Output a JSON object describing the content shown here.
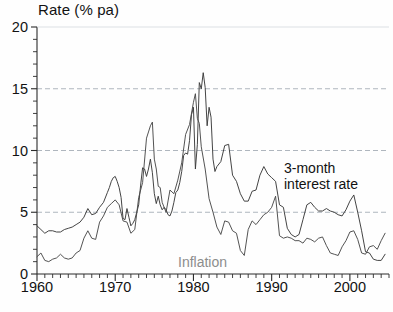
{
  "chart_data": {
    "type": "line",
    "title": "Rate (% pa)",
    "xlabel": "",
    "ylabel": "Rate (% pa)",
    "xlim": [
      1960,
      2005
    ],
    "ylim": [
      0,
      20
    ],
    "yticks": [
      0,
      5,
      10,
      15,
      20
    ],
    "ytick_labels": [
      "0",
      "5",
      "10",
      "15",
      "20"
    ],
    "yminor_step": 1,
    "xticks": [
      1960,
      1970,
      1980,
      1990,
      2000
    ],
    "xtick_labels": [
      "1960",
      "1970",
      "1980",
      "1990",
      "2000"
    ],
    "xminor_step": 1,
    "grid": "horizontal-dashed-at-major-yticks",
    "legend": "inline-annotations",
    "annotations": [
      {
        "name": "interest-rate-annotation",
        "text": "3-month\ninterest rate",
        "color": "#111111",
        "x": 284,
        "y": 160
      },
      {
        "name": "inflation-annotation",
        "text": "Inflation",
        "color": "#8d8d8d",
        "x": 178,
        "y": 254
      }
    ],
    "series": [
      {
        "name": "3-month interest rate",
        "color": "#3a3a3a",
        "x": [
          1960.0,
          1960.5,
          1961.0,
          1961.5,
          1962.0,
          1962.5,
          1963.0,
          1963.5,
          1964.0,
          1964.5,
          1965.0,
          1965.5,
          1966.0,
          1966.5,
          1967.0,
          1967.5,
          1968.0,
          1968.5,
          1969.0,
          1969.25,
          1969.5,
          1969.75,
          1970.0,
          1970.25,
          1970.5,
          1970.75,
          1971.0,
          1971.25,
          1971.5,
          1971.75,
          1972.0,
          1972.25,
          1972.5,
          1972.75,
          1973.0,
          1973.25,
          1973.5,
          1973.75,
          1974.0,
          1974.25,
          1974.5,
          1974.75,
          1975.0,
          1975.25,
          1975.5,
          1975.75,
          1976.0,
          1976.25,
          1976.5,
          1976.75,
          1977.0,
          1977.25,
          1977.5,
          1977.75,
          1978.0,
          1978.25,
          1978.5,
          1978.75,
          1979.0,
          1979.25,
          1979.5,
          1979.75,
          1980.0,
          1980.25,
          1980.5,
          1980.75,
          1981.0,
          1981.25,
          1981.5,
          1981.75,
          1982.0,
          1982.25,
          1982.5,
          1982.75,
          1983.0,
          1983.5,
          1984.0,
          1984.5,
          1985.0,
          1985.5,
          1986.0,
          1986.5,
          1987.0,
          1987.5,
          1988.0,
          1988.5,
          1989.0,
          1989.5,
          1990.0,
          1990.5,
          1991.0,
          1991.5,
          1992.0,
          1992.5,
          1993.0,
          1993.5,
          1994.0,
          1994.5,
          1995.0,
          1995.5,
          1996.0,
          1996.5,
          1997.0,
          1997.5,
          1998.0,
          1998.5,
          1999.0,
          1999.5,
          2000.0,
          2000.5,
          2001.0,
          2001.5,
          2002.0,
          2002.5,
          2003.0,
          2003.5,
          2004.0,
          2004.5
        ],
        "y": [
          3.9,
          3.6,
          3.3,
          3.5,
          3.5,
          3.4,
          3.4,
          3.6,
          3.7,
          3.8,
          4.0,
          4.2,
          4.6,
          5.3,
          4.8,
          4.9,
          5.4,
          5.8,
          6.6,
          7.0,
          7.5,
          7.8,
          7.9,
          7.5,
          7.0,
          6.2,
          4.5,
          4.4,
          5.3,
          4.6,
          3.9,
          4.1,
          4.4,
          5.0,
          5.6,
          7.2,
          8.6,
          8.5,
          7.9,
          8.5,
          9.3,
          8.2,
          6.5,
          5.7,
          6.3,
          5.6,
          5.2,
          5.4,
          5.2,
          4.8,
          4.7,
          5.1,
          5.8,
          6.6,
          6.8,
          7.4,
          8.3,
          9.6,
          9.8,
          9.7,
          10.8,
          12.9,
          13.5,
          8.5,
          10.5,
          15.5,
          15.0,
          16.3,
          15.1,
          12.0,
          13.5,
          12.7,
          9.3,
          8.3,
          8.7,
          9.1,
          10.4,
          10.5,
          8.0,
          7.5,
          6.5,
          5.9,
          5.9,
          6.7,
          6.8,
          8.0,
          8.7,
          8.1,
          7.8,
          7.5,
          5.6,
          5.4,
          3.7,
          3.2,
          3.0,
          3.2,
          4.4,
          5.6,
          5.8,
          5.4,
          5.1,
          5.1,
          5.3,
          5.1,
          5.0,
          4.8,
          4.7,
          5.2,
          5.9,
          6.4,
          5.0,
          3.5,
          1.8,
          1.7,
          1.2,
          1.1,
          1.1,
          1.6
        ]
      },
      {
        "name": "Inflation",
        "color": "#4a4a4a",
        "x": [
          1960.0,
          1960.5,
          1961.0,
          1961.5,
          1962.0,
          1962.5,
          1963.0,
          1963.5,
          1964.0,
          1964.5,
          1965.0,
          1965.5,
          1966.0,
          1966.5,
          1967.0,
          1967.5,
          1968.0,
          1968.5,
          1969.0,
          1969.5,
          1970.0,
          1970.5,
          1971.0,
          1971.5,
          1972.0,
          1972.5,
          1973.0,
          1973.5,
          1974.0,
          1974.25,
          1974.5,
          1974.75,
          1975.0,
          1975.25,
          1975.5,
          1975.75,
          1976.0,
          1976.5,
          1977.0,
          1977.5,
          1978.0,
          1978.5,
          1979.0,
          1979.5,
          1980.0,
          1980.25,
          1980.5,
          1980.75,
          1981.0,
          1981.5,
          1982.0,
          1982.5,
          1983.0,
          1983.5,
          1984.0,
          1984.5,
          1985.0,
          1985.5,
          1986.0,
          1986.5,
          1987.0,
          1987.5,
          1988.0,
          1988.5,
          1989.0,
          1989.5,
          1990.0,
          1990.5,
          1991.0,
          1991.5,
          1992.0,
          1992.5,
          1993.0,
          1993.5,
          1994.0,
          1994.5,
          1995.0,
          1995.5,
          1996.0,
          1996.5,
          1997.0,
          1997.5,
          1998.0,
          1998.5,
          1999.0,
          1999.5,
          2000.0,
          2000.5,
          2001.0,
          2001.5,
          2002.0,
          2002.5,
          2003.0,
          2003.5,
          2004.0,
          2004.5
        ],
        "y": [
          1.4,
          1.7,
          1.1,
          1.0,
          1.2,
          1.3,
          1.6,
          1.3,
          1.2,
          1.3,
          1.7,
          1.9,
          2.9,
          3.5,
          2.9,
          2.8,
          4.2,
          4.7,
          5.4,
          5.7,
          6.0,
          5.6,
          4.3,
          4.2,
          3.3,
          3.6,
          6.2,
          7.4,
          11.0,
          11.5,
          12.0,
          12.3,
          9.3,
          8.5,
          7.1,
          7.0,
          5.8,
          5.0,
          6.8,
          6.5,
          7.6,
          9.0,
          11.3,
          12.1,
          13.9,
          14.6,
          12.6,
          12.2,
          10.3,
          8.5,
          6.1,
          5.0,
          3.8,
          3.2,
          4.3,
          4.2,
          3.5,
          3.3,
          1.9,
          1.5,
          3.6,
          4.3,
          4.0,
          4.4,
          4.8,
          5.0,
          5.4,
          6.3,
          3.1,
          2.9,
          3.0,
          2.9,
          2.7,
          2.7,
          2.5,
          2.9,
          2.8,
          2.6,
          2.9,
          3.0,
          2.3,
          1.7,
          1.6,
          1.5,
          2.2,
          2.7,
          3.4,
          3.5,
          2.8,
          1.7,
          1.6,
          2.2,
          2.3,
          2.0,
          2.7,
          3.3
        ]
      }
    ]
  },
  "axis": {
    "title": "Rate (% pa)"
  }
}
